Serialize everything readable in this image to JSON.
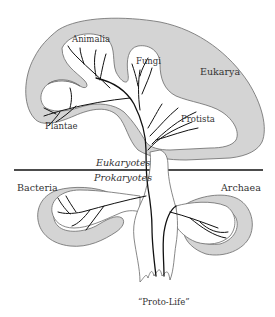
{
  "figure": {
    "type": "tree-of-life-diagram",
    "divider": {
      "above_label": "Eukaryotes",
      "below_label": "Prokaryotes"
    },
    "domains": [
      {
        "name": "Eukarya",
        "position": "top-right"
      },
      {
        "name": "Bacteria",
        "position": "lower-left"
      },
      {
        "name": "Archaea",
        "position": "lower-right"
      }
    ],
    "kingdoms": [
      {
        "name": "Animalia",
        "domain": "Eukarya"
      },
      {
        "name": "Fungi",
        "domain": "Eukarya"
      },
      {
        "name": "Plantae",
        "domain": "Eukarya"
      },
      {
        "name": "Protista",
        "domain": "Eukarya"
      }
    ],
    "root": {
      "label": "“Proto-Life”"
    },
    "colors": {
      "region_fill": "#d4d4d4",
      "outline": "#6a6a6a",
      "branches": "#111111",
      "background": "#ffffff"
    }
  },
  "labels": {
    "animalia": "Animalia",
    "fungi": "Fungi",
    "plantae": "Plantae",
    "protista": "Protista",
    "eukarya": "Eukarya",
    "eukaryotes": "Eukaryotes",
    "prokaryotes": "Prokaryotes",
    "bacteria": "Bacteria",
    "archaea": "Archaea",
    "proto_life": "“Proto-Life”"
  }
}
